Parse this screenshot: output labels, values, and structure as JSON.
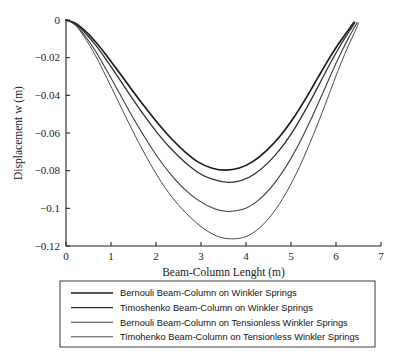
{
  "chart_data": {
    "type": "line",
    "title": "",
    "xlabel": "Beam-Column Lenght (m)",
    "ylabel": "Displacement w (m)",
    "xlim": [
      0,
      7
    ],
    "ylim": [
      -0.12,
      0
    ],
    "xticks": [
      0,
      1,
      2,
      3,
      4,
      5,
      6,
      7
    ],
    "xticklabels": [
      "0",
      "1",
      "2",
      "3",
      "4",
      "5",
      "6",
      "7"
    ],
    "yticks": [
      0,
      -0.02,
      -0.04,
      -0.06,
      -0.08,
      -0.1,
      -0.12
    ],
    "yticklabels": [
      "0",
      "−0.02",
      "−0.04",
      "−0.06",
      "−0.08",
      "−0.1",
      "−0.12"
    ],
    "grid": false,
    "legend_position": "below-axes",
    "series": [
      {
        "name": "Bernouli Beam-Column on Winkler Springs",
        "color": "#1c1c1c",
        "width": 1.7,
        "minimum": {
          "x": 3.55,
          "y": -0.0797
        },
        "x": [
          0,
          0.2,
          0.4,
          0.65,
          0.9,
          1.15,
          1.45,
          1.75,
          2.05,
          2.35,
          2.65,
          2.95,
          3.25,
          3.55,
          3.85,
          4.15,
          4.45,
          4.75,
          5.05,
          5.35,
          5.6,
          5.85,
          6.05,
          6.2,
          6.32,
          6.4
        ],
        "y": [
          0,
          -0.0016,
          -0.0053,
          -0.0114,
          -0.0188,
          -0.0268,
          -0.0366,
          -0.0461,
          -0.0551,
          -0.0632,
          -0.0701,
          -0.0756,
          -0.0787,
          -0.0797,
          -0.0786,
          -0.0752,
          -0.0695,
          -0.0619,
          -0.0522,
          -0.0408,
          -0.0305,
          -0.0204,
          -0.0129,
          -0.0078,
          -0.0039,
          -0.0012
        ]
      },
      {
        "name": "Timoshenko Beam-Column on Winkler Springs",
        "color": "#303030",
        "width": 1.3,
        "minimum": {
          "x": 3.6,
          "y": -0.0862
        },
        "x": [
          0,
          0.2,
          0.4,
          0.65,
          0.9,
          1.15,
          1.45,
          1.75,
          2.05,
          2.35,
          2.65,
          2.95,
          3.25,
          3.6,
          3.9,
          4.2,
          4.5,
          4.8,
          5.1,
          5.4,
          5.65,
          5.9,
          6.1,
          6.25,
          6.35,
          6.42
        ],
        "y": [
          0,
          -0.0019,
          -0.0062,
          -0.0131,
          -0.0213,
          -0.0301,
          -0.0408,
          -0.0511,
          -0.0606,
          -0.0688,
          -0.0757,
          -0.0812,
          -0.0845,
          -0.0862,
          -0.0852,
          -0.0816,
          -0.0756,
          -0.0674,
          -0.0569,
          -0.0444,
          -0.0331,
          -0.0218,
          -0.0134,
          -0.0077,
          -0.0041,
          -0.0014
        ]
      },
      {
        "name": "Bernouli Beam-Column on Tensionless Winkler Springs",
        "color": "#3d3d3d",
        "width": 1.1,
        "minimum": {
          "x": 3.6,
          "y": -0.1017
        },
        "x": [
          0,
          0.2,
          0.4,
          0.65,
          0.9,
          1.15,
          1.45,
          1.75,
          2.05,
          2.35,
          2.65,
          2.95,
          3.3,
          3.6,
          3.95,
          4.25,
          4.55,
          4.85,
          5.15,
          5.45,
          5.7,
          5.95,
          6.15,
          6.3,
          6.4,
          6.47
        ],
        "y": [
          0,
          -0.0023,
          -0.0077,
          -0.0163,
          -0.0266,
          -0.0373,
          -0.0502,
          -0.0623,
          -0.0733,
          -0.0826,
          -0.0902,
          -0.0959,
          -0.1002,
          -0.1017,
          -0.1004,
          -0.0962,
          -0.0891,
          -0.0793,
          -0.067,
          -0.0524,
          -0.0392,
          -0.0256,
          -0.0155,
          -0.0086,
          -0.0043,
          -0.0014
        ]
      },
      {
        "name": "Timohenko Beam-Column on Tensionless Winkler Springs",
        "color": "#4a4a4a",
        "width": 1.0,
        "minimum": {
          "x": 3.68,
          "y": -0.1162
        },
        "x": [
          0,
          0.2,
          0.4,
          0.65,
          0.9,
          1.15,
          1.45,
          1.75,
          2.05,
          2.35,
          2.65,
          3.0,
          3.35,
          3.68,
          4.0,
          4.3,
          4.6,
          4.9,
          5.2,
          5.5,
          5.75,
          6.0,
          6.2,
          6.35,
          6.45,
          6.5
        ],
        "y": [
          0,
          -0.0026,
          -0.0088,
          -0.0187,
          -0.0305,
          -0.0427,
          -0.0574,
          -0.0711,
          -0.0835,
          -0.0939,
          -0.1021,
          -0.1097,
          -0.1147,
          -0.1162,
          -0.115,
          -0.1104,
          -0.1025,
          -0.0914,
          -0.0774,
          -0.0607,
          -0.0455,
          -0.0297,
          -0.0178,
          -0.0097,
          -0.0047,
          -0.0016
        ]
      }
    ]
  },
  "legend": {
    "entries": [
      "Bernouli Beam-Column on Winkler Springs",
      "Timoshenko Beam-Column on Winkler Springs",
      "Bernouli Beam-Column on Tensionless Winkler Springs",
      "Timohenko Beam-Column on Tensionless Winkler Springs"
    ]
  },
  "colors": {
    "axis": "#222222",
    "text": "#1a1a1a",
    "legend_border": "#3a3a3a",
    "background": "#ffffff"
  }
}
